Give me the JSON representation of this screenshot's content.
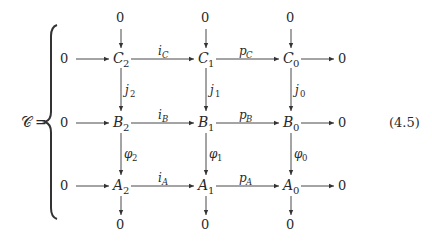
{
  "equation": {
    "lhs": "𝒞",
    "equals": "=",
    "number": "(4.5)"
  },
  "zero": "0",
  "rows": [
    {
      "letter": "C",
      "nodes": [
        {
          "sub": "2"
        },
        {
          "sub": "1"
        },
        {
          "sub": "0"
        }
      ],
      "maps": [
        {
          "sym": "i",
          "sub": "C"
        },
        {
          "sym": "p",
          "sub": "C"
        }
      ]
    },
    {
      "letter": "B",
      "nodes": [
        {
          "sub": "2"
        },
        {
          "sub": "1"
        },
        {
          "sub": "0"
        }
      ],
      "maps": [
        {
          "sym": "i",
          "sub": "B"
        },
        {
          "sym": "p",
          "sub": "B"
        }
      ]
    },
    {
      "letter": "A",
      "nodes": [
        {
          "sub": "2"
        },
        {
          "sub": "1"
        },
        {
          "sub": "0"
        }
      ],
      "maps": [
        {
          "sym": "i",
          "sub": "A"
        },
        {
          "sym": "p",
          "sub": "A"
        }
      ]
    }
  ],
  "vertical_maps": {
    "upper": [
      {
        "sym": "j",
        "sub": "2"
      },
      {
        "sym": "j",
        "sub": "1"
      },
      {
        "sym": "j",
        "sub": "0"
      }
    ],
    "lower": [
      {
        "sym": "φ",
        "sub": "2"
      },
      {
        "sym": "φ",
        "sub": "1"
      },
      {
        "sym": "φ",
        "sub": "0"
      }
    ]
  }
}
